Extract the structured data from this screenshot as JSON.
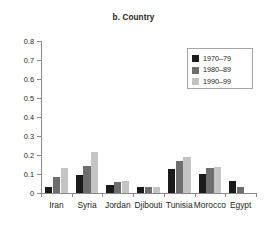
{
  "chart_data": {
    "type": "bar",
    "title": "b. Country",
    "xlabel": "",
    "ylabel": "",
    "ylim": [
      0,
      0.8
    ],
    "ytick_labels": [
      "0",
      "0.1",
      "0.2",
      "0.3",
      "0.4",
      "0.5",
      "0.6",
      "0.7",
      "0.8"
    ],
    "ytick_values": [
      0,
      0.1,
      0.2,
      0.3,
      0.4,
      0.5,
      0.6,
      0.7,
      0.8
    ],
    "grid": false,
    "legend_position": "upper right",
    "categories": [
      "Iran",
      "Syria",
      "Jordan",
      "Djibouti",
      "Tunisia",
      "Morocco",
      "Egypt"
    ],
    "series": [
      {
        "name": "1970–79",
        "color": "#1a1a1a",
        "values": [
          0.033,
          0.095,
          0.043,
          0.03,
          0.124,
          0.099,
          0.062
        ]
      },
      {
        "name": "1980–89",
        "color": "#6e6e6e",
        "values": [
          0.082,
          0.14,
          0.057,
          0.03,
          0.169,
          0.132,
          0.033
        ]
      },
      {
        "name": "1990–99",
        "color": "#c4c4c4",
        "values": [
          0.132,
          0.216,
          0.065,
          0.03,
          0.189,
          0.135,
          0.0
        ]
      }
    ]
  },
  "axis": {
    "line_color": "#8a8a8a"
  }
}
